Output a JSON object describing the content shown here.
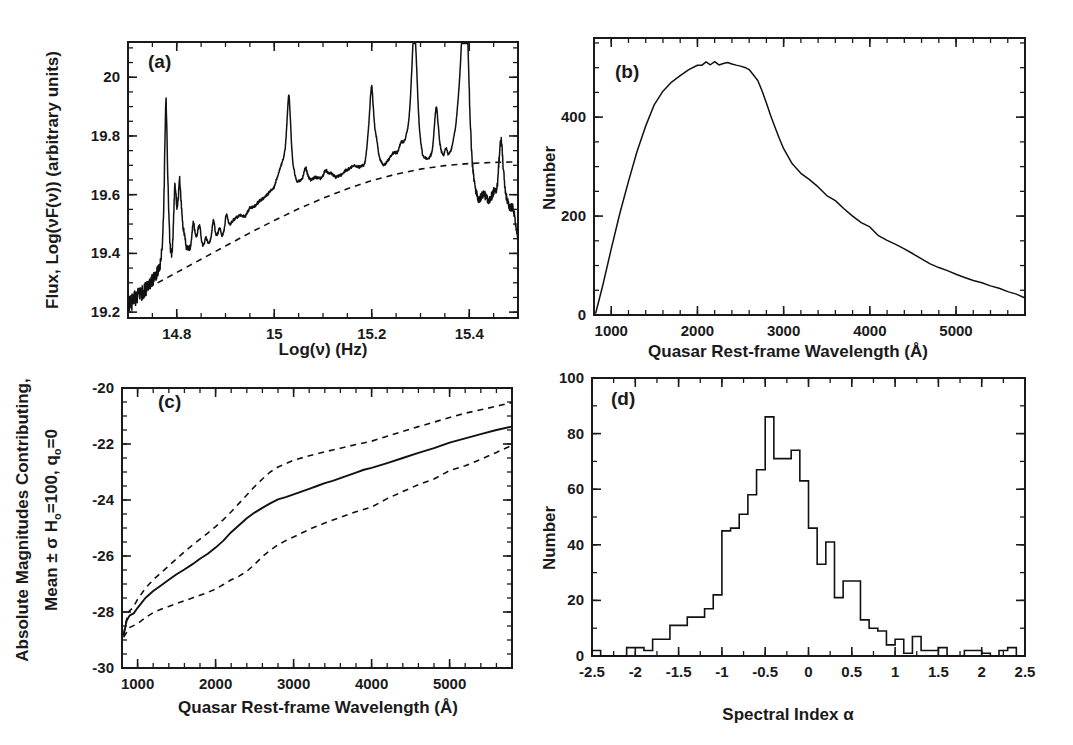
{
  "figure": {
    "panels": [
      "(a)",
      "(b)",
      "(c)",
      "(d)"
    ]
  },
  "panel_a": {
    "label": "(a)",
    "ylabel": "Flux, Log(νF(ν))  (arbitrary units)",
    "xlabel": "Log(ν)   (Hz)",
    "xticklabels": [
      "14.8",
      "15",
      "15.2",
      "15.4"
    ],
    "xtickvalues": [
      14.8,
      15.0,
      15.2,
      15.4
    ],
    "yticklabels": [
      "19.2",
      "19.4",
      "19.6",
      "19.8",
      "20"
    ],
    "ytickvalues": [
      19.2,
      19.4,
      19.6,
      19.8,
      20.0
    ],
    "xlim": [
      14.7,
      15.5
    ],
    "ylim": [
      19.18,
      20.12
    ]
  },
  "panel_b": {
    "label": "(b)",
    "ylabel": "Number",
    "xlabel": "Quasar Rest-frame Wavelength (Å)",
    "xticklabels": [
      "1000",
      "2000",
      "3000",
      "4000",
      "5000"
    ],
    "xtickvalues": [
      1000,
      2000,
      3000,
      4000,
      5000
    ],
    "yticklabels": [
      "0",
      "200",
      "400"
    ],
    "ytickvalues": [
      0,
      200,
      400
    ],
    "xlim": [
      800,
      5800
    ],
    "ylim": [
      0,
      560
    ]
  },
  "panel_c": {
    "label": "(c)",
    "ylabel_line1": "Absolute Magnitudes Contributing,",
    "ylabel_line2": "Mean ± σ   H",
    "ylabel_line2b": "=100, q",
    "ylabel_line2c": "=0",
    "ylabel_sub": "o",
    "xlabel": "Quasar Rest-frame Wavelength (Å)",
    "xticklabels": [
      "1000",
      "2000",
      "3000",
      "4000",
      "5000"
    ],
    "xtickvalues": [
      1000,
      2000,
      3000,
      4000,
      5000
    ],
    "yticklabels": [
      "-30",
      "-28",
      "-26",
      "-24",
      "-22",
      "-20"
    ],
    "ytickvalues": [
      -30,
      -28,
      -26,
      -24,
      -22,
      -20
    ],
    "xlim": [
      800,
      5800
    ],
    "ylim": [
      -30,
      -20
    ]
  },
  "panel_d": {
    "label": "(d)",
    "ylabel": "Number",
    "xlabel": "Spectral Index α",
    "xticklabels": [
      "-2.5",
      "-2",
      "-1.5",
      "-1",
      "-0.5",
      "0",
      "0.5",
      "1",
      "1.5",
      "2",
      "2.5"
    ],
    "xtickvalues": [
      -2.5,
      -2,
      -1.5,
      -1,
      -0.5,
      0,
      0.5,
      1,
      1.5,
      2,
      2.5
    ],
    "yticklabels": [
      "0",
      "20",
      "40",
      "60",
      "80",
      "100"
    ],
    "ytickvalues": [
      0,
      20,
      40,
      60,
      80,
      100
    ],
    "xlim": [
      -2.5,
      2.5
    ],
    "ylim": [
      0,
      100
    ]
  },
  "chart_data": [
    {
      "type": "line",
      "panel": "(a)",
      "title": "Composite quasar spectrum",
      "xlabel": "Log(ν)   (Hz)",
      "ylabel": "Flux, Log(νF(ν))  (arbitrary units)",
      "xlim": [
        14.7,
        15.5
      ],
      "ylim": [
        19.18,
        20.12
      ],
      "grid": false,
      "legend": "none",
      "series": [
        {
          "name": "composite spectrum",
          "style": "solid",
          "x": [
            14.7,
            14.708,
            14.715,
            14.722,
            14.73,
            14.737,
            14.744,
            14.752,
            14.759,
            14.766,
            14.77,
            14.774,
            14.778,
            14.782,
            14.786,
            14.79,
            14.795,
            14.8,
            14.806,
            14.812,
            14.82,
            14.828,
            14.836,
            14.844,
            14.852,
            14.86,
            14.868,
            14.876,
            14.884,
            14.892,
            14.9,
            14.91,
            14.92,
            14.93,
            14.94,
            14.95,
            14.96,
            14.97,
            14.98,
            14.99,
            15.0,
            15.01,
            15.02,
            15.03,
            15.038,
            15.046,
            15.055,
            15.065,
            15.075,
            15.085,
            15.095,
            15.105,
            15.115,
            15.125,
            15.135,
            15.145,
            15.155,
            15.165,
            15.175,
            15.185,
            15.195,
            15.2,
            15.207,
            15.215,
            15.225,
            15.235,
            15.245,
            15.255,
            15.265,
            15.275,
            15.285,
            15.29,
            15.297,
            15.305,
            15.315,
            15.325,
            15.333,
            15.34,
            15.348,
            15.356,
            15.364,
            15.372,
            15.38,
            15.388,
            15.394,
            15.4,
            15.406,
            15.412,
            15.42,
            15.43,
            15.44,
            15.45,
            15.458,
            15.466,
            15.474,
            15.482,
            15.49,
            15.5
          ],
          "y": [
            19.225,
            19.232,
            19.245,
            19.258,
            19.268,
            19.282,
            19.295,
            19.31,
            19.33,
            19.36,
            19.42,
            19.54,
            19.7,
            19.56,
            19.42,
            19.39,
            19.43,
            19.52,
            19.66,
            19.5,
            19.42,
            19.415,
            19.43,
            19.47,
            19.43,
            19.425,
            19.44,
            19.47,
            19.46,
            19.455,
            19.48,
            19.5,
            19.52,
            19.53,
            19.525,
            19.555,
            19.56,
            19.58,
            19.59,
            19.61,
            19.625,
            19.68,
            19.73,
            19.79,
            19.7,
            19.645,
            19.65,
            19.665,
            19.65,
            19.66,
            19.655,
            19.66,
            19.675,
            19.66,
            19.665,
            19.68,
            19.69,
            19.7,
            19.695,
            19.7,
            19.74,
            19.84,
            19.77,
            19.72,
            19.7,
            19.72,
            19.745,
            19.735,
            19.76,
            19.83,
            19.945,
            19.9,
            19.8,
            19.73,
            19.72,
            19.74,
            19.8,
            19.76,
            19.72,
            19.725,
            19.76,
            19.83,
            19.96,
            20.05,
            19.99,
            19.84,
            19.7,
            19.62,
            19.58,
            19.605,
            19.575,
            19.61,
            19.59,
            19.68,
            19.6,
            19.56,
            19.555,
            19.45
          ]
        },
        {
          "name": "continuum fit",
          "style": "dashed",
          "x": [
            14.7,
            14.75,
            14.8,
            14.85,
            14.9,
            14.95,
            15.0,
            15.05,
            15.1,
            15.15,
            15.2,
            15.25,
            15.3,
            15.35,
            15.4,
            15.45,
            15.5
          ],
          "y": [
            19.25,
            19.29,
            19.335,
            19.38,
            19.425,
            19.47,
            19.512,
            19.552,
            19.588,
            19.62,
            19.648,
            19.67,
            19.687,
            19.699,
            19.706,
            19.71,
            19.712
          ]
        }
      ],
      "annotations": [
        {
          "text": "(a)",
          "position": "top-left"
        },
        {
          "text": "strong emission lines near logν = 14.78, 15.03, 15.20, 15.29, 15.33, 15.39"
        }
      ]
    },
    {
      "type": "line",
      "panel": "(b)",
      "title": "Number of spectra contributing vs rest wavelength",
      "xlabel": "Quasar Rest-frame Wavelength (Å)",
      "ylabel": "Number",
      "xlim": [
        800,
        5800
      ],
      "ylim": [
        0,
        560
      ],
      "grid": false,
      "legend": "none",
      "series": [
        {
          "name": "Number",
          "style": "solid",
          "x": [
            820,
            900,
            1000,
            1100,
            1200,
            1300,
            1400,
            1500,
            1600,
            1700,
            1800,
            1900,
            2000,
            2050,
            2100,
            2150,
            2200,
            2250,
            2300,
            2350,
            2400,
            2450,
            2500,
            2550,
            2600,
            2650,
            2700,
            2750,
            2800,
            2850,
            2900,
            2950,
            3000,
            3100,
            3200,
            3300,
            3400,
            3500,
            3600,
            3700,
            3800,
            3900,
            4000,
            4100,
            4200,
            4300,
            4400,
            4500,
            4600,
            4700,
            4800,
            4900,
            5000,
            5100,
            5200,
            5300,
            5400,
            5500,
            5600,
            5700,
            5800
          ],
          "y": [
            5,
            60,
            135,
            205,
            270,
            330,
            382,
            424,
            452,
            470,
            484,
            495,
            503,
            506,
            510,
            506,
            512,
            507,
            509,
            511,
            509,
            506,
            504,
            499,
            495,
            487,
            474,
            452,
            428,
            402,
            380,
            358,
            338,
            305,
            288,
            272,
            258,
            243,
            231,
            216,
            200,
            188,
            178,
            160,
            150,
            142,
            133,
            124,
            114,
            104,
            97,
            90,
            83,
            77,
            71,
            65,
            59,
            53,
            47,
            41,
            34
          ]
        }
      ],
      "annotations": [
        {
          "text": "(b)",
          "position": "top-left"
        }
      ]
    },
    {
      "type": "line",
      "panel": "(c)",
      "title": "Absolute magnitudes contributing vs rest wavelength",
      "xlabel": "Quasar Rest-frame Wavelength (Å)",
      "ylabel": "Absolute Magnitudes Contributing, Mean ± σ  Hₒ=100, qₒ=0",
      "xlim": [
        800,
        5800
      ],
      "ylim": [
        -30,
        -20
      ],
      "yaxis_inverted": true,
      "grid": false,
      "legend": "none",
      "series": [
        {
          "name": "Mean",
          "style": "solid",
          "x": [
            820,
            860,
            900,
            950,
            1000,
            1100,
            1200,
            1300,
            1400,
            1500,
            1600,
            1700,
            1800,
            1900,
            2000,
            2100,
            2200,
            2300,
            2400,
            2500,
            2600,
            2700,
            2800,
            2900,
            3000,
            3100,
            3200,
            3300,
            3400,
            3500,
            3600,
            3700,
            3800,
            3900,
            4000,
            4200,
            4400,
            4600,
            4800,
            5000,
            5200,
            5400,
            5600,
            5800
          ],
          "y": [
            -28.85,
            -28.3,
            -28.12,
            -28.05,
            -27.85,
            -27.5,
            -27.25,
            -27.05,
            -26.85,
            -26.65,
            -26.48,
            -26.3,
            -26.1,
            -25.92,
            -25.7,
            -25.45,
            -25.15,
            -24.9,
            -24.65,
            -24.45,
            -24.28,
            -24.12,
            -23.98,
            -23.9,
            -23.8,
            -23.7,
            -23.6,
            -23.5,
            -23.4,
            -23.32,
            -23.22,
            -23.12,
            -23.02,
            -22.92,
            -22.85,
            -22.68,
            -22.5,
            -22.32,
            -22.15,
            -21.95,
            -21.8,
            -21.65,
            -21.5,
            -21.38
          ]
        },
        {
          "name": "Mean + σ",
          "style": "dashed",
          "x": [
            820,
            900,
            1000,
            1100,
            1200,
            1300,
            1400,
            1500,
            1600,
            1700,
            1800,
            1900,
            2000,
            2100,
            2200,
            2300,
            2400,
            2500,
            2600,
            2700,
            2800,
            2900,
            3000,
            3200,
            3400,
            3600,
            3800,
            4000,
            4200,
            4400,
            4600,
            4800,
            5000,
            5200,
            5400,
            5600,
            5800
          ],
          "y": [
            -28.9,
            -28.55,
            -28.42,
            -28.2,
            -28.02,
            -27.9,
            -27.8,
            -27.7,
            -27.6,
            -27.5,
            -27.4,
            -27.3,
            -27.18,
            -27.02,
            -26.85,
            -26.72,
            -26.55,
            -26.3,
            -26.02,
            -25.8,
            -25.6,
            -25.45,
            -25.32,
            -25.05,
            -24.82,
            -24.62,
            -24.42,
            -24.25,
            -23.95,
            -23.7,
            -23.45,
            -23.25,
            -22.95,
            -22.78,
            -22.55,
            -22.3,
            -22.05
          ]
        },
        {
          "name": "Mean - σ",
          "style": "dashed",
          "x": [
            820,
            880,
            940,
            1000,
            1100,
            1200,
            1300,
            1400,
            1500,
            1600,
            1700,
            1800,
            1900,
            2000,
            2100,
            2200,
            2300,
            2400,
            2500,
            2600,
            2700,
            2800,
            2900,
            3000,
            3200,
            3400,
            3600,
            3800,
            4000,
            4200,
            4400,
            4600,
            4800,
            5000,
            5200,
            5400,
            5600,
            5800
          ],
          "y": [
            -28.8,
            -28.0,
            -27.85,
            -27.55,
            -27.15,
            -26.85,
            -26.6,
            -26.35,
            -26.1,
            -25.85,
            -25.62,
            -25.4,
            -25.18,
            -24.95,
            -24.7,
            -24.42,
            -24.12,
            -23.82,
            -23.52,
            -23.25,
            -23.0,
            -22.82,
            -22.7,
            -22.58,
            -22.42,
            -22.28,
            -22.15,
            -22.02,
            -21.9,
            -21.72,
            -21.55,
            -21.38,
            -21.22,
            -21.05,
            -20.9,
            -20.78,
            -20.65,
            -20.52
          ]
        }
      ],
      "annotations": [
        {
          "text": "(c)",
          "position": "top-left"
        }
      ]
    },
    {
      "type": "bar",
      "subtype": "histogram",
      "panel": "(d)",
      "title": "Distribution of spectral index",
      "xlabel": "Spectral Index α",
      "ylabel": "Number",
      "xlim": [
        -2.5,
        2.5
      ],
      "ylim": [
        0,
        100
      ],
      "bin_width": 0.1,
      "grid": false,
      "legend": "none",
      "bin_edges": [
        -2.5,
        -2.4,
        -2.3,
        -2.2,
        -2.1,
        -2.0,
        -1.9,
        -1.8,
        -1.7,
        -1.6,
        -1.5,
        -1.4,
        -1.3,
        -1.2,
        -1.1,
        -1.0,
        -0.9,
        -0.8,
        -0.7,
        -0.6,
        -0.5,
        -0.4,
        -0.3,
        -0.2,
        -0.1,
        0.0,
        0.1,
        0.2,
        0.3,
        0.4,
        0.5,
        0.6,
        0.7,
        0.8,
        0.9,
        1.0,
        1.1,
        1.2,
        1.3,
        1.4,
        1.5,
        1.6,
        1.7,
        1.8,
        1.9,
        2.0,
        2.1,
        2.2,
        2.3,
        2.4,
        2.5
      ],
      "values": [
        2,
        0,
        0,
        0,
        3,
        3,
        2,
        6,
        6,
        11,
        11,
        14,
        14,
        17,
        22,
        45,
        46,
        51,
        58,
        67,
        86,
        71,
        71,
        74,
        63,
        46,
        33,
        41,
        21,
        27,
        27,
        13,
        10,
        9,
        4,
        6,
        1,
        7,
        2,
        2,
        3,
        0,
        0,
        2,
        2,
        1,
        0,
        2,
        3,
        0
      ]
    }
  ]
}
